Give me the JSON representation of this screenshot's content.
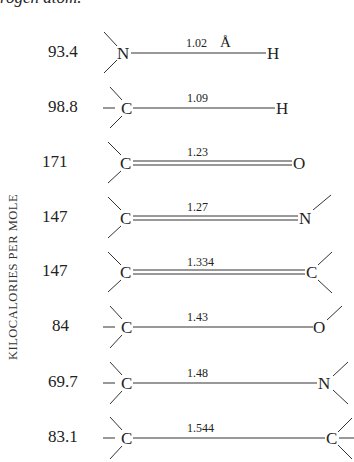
{
  "caption": "rogen atom.",
  "y_axis_label": "KILOCALORIES  PER  MOLE",
  "units": "Å",
  "rows": [
    {
      "energy": "93.4",
      "left_atom": "N",
      "right_atom": "H",
      "bond_length": "1.02",
      "bond_order": 1,
      "left_subst": 2,
      "right_subst": 0,
      "unit_shown": true
    },
    {
      "energy": "98.8",
      "left_atom": "C",
      "right_atom": "H",
      "bond_length": "1.09",
      "bond_order": 1,
      "left_subst": 3,
      "right_subst": 0,
      "unit_shown": false
    },
    {
      "energy": "171",
      "left_atom": "C",
      "right_atom": "O",
      "bond_length": "1.23",
      "bond_order": 2,
      "left_subst": 2,
      "right_subst": 0,
      "unit_shown": false
    },
    {
      "energy": "147",
      "left_atom": "C",
      "right_atom": "N",
      "bond_length": "1.27",
      "bond_order": 2,
      "left_subst": 2,
      "right_subst": 1,
      "unit_shown": false
    },
    {
      "energy": "147",
      "left_atom": "C",
      "right_atom": "C",
      "bond_length": "1.334",
      "bond_order": 2,
      "left_subst": 2,
      "right_subst": 2,
      "unit_shown": false
    },
    {
      "energy": "84",
      "left_atom": "C",
      "right_atom": "O",
      "bond_length": "1.43",
      "bond_order": 1,
      "left_subst": 3,
      "right_subst": 1,
      "unit_shown": false
    },
    {
      "energy": "69.7",
      "left_atom": "C",
      "right_atom": "N",
      "bond_length": "1.48",
      "bond_order": 1,
      "left_subst": 3,
      "right_subst": 2,
      "unit_shown": false
    },
    {
      "energy": "83.1",
      "left_atom": "C",
      "right_atom": "C",
      "bond_length": "1.544",
      "bond_order": 1,
      "left_subst": 3,
      "right_subst": 3,
      "unit_shown": false
    }
  ]
}
